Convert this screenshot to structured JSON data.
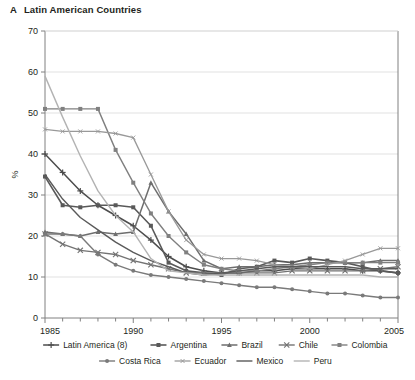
{
  "figure": {
    "panel_letter": "A",
    "title": "Latin American Countries"
  },
  "chart_data": {
    "type": "line",
    "title": "Latin American Countries",
    "xlabel": "",
    "ylabel": "%",
    "xlim": [
      1985,
      2005
    ],
    "ylim": [
      0,
      70
    ],
    "ytick_step": 10,
    "yticks": [
      0,
      10,
      20,
      30,
      40,
      50,
      60,
      70
    ],
    "xticks_labeled": [
      1985,
      1990,
      1995,
      2000,
      2005
    ],
    "x_minor_tick_step": 1,
    "grid": "horizontal",
    "legend_position": "below",
    "x": [
      1985,
      1986,
      1987,
      1988,
      1989,
      1990,
      1991,
      1992,
      1993,
      1994,
      1995,
      1996,
      1997,
      1998,
      1999,
      2000,
      2001,
      2002,
      2003,
      2004,
      2005
    ],
    "series": [
      {
        "name": "Latin America (8)",
        "color": "#4d4d4d",
        "marker": "plus",
        "width": 1.5,
        "values": [
          40,
          35.5,
          31,
          27.5,
          25,
          22.5,
          19,
          15,
          12.5,
          11.5,
          11,
          11,
          11.5,
          11.5,
          12,
          12,
          12,
          12,
          11.5,
          11.5,
          11
        ]
      },
      {
        "name": "Argentina",
        "color": "#595959",
        "marker": "square",
        "width": 1.6,
        "values": [
          34.5,
          27.5,
          27,
          27.5,
          27.5,
          27,
          22.5,
          13.5,
          11.5,
          11,
          10.5,
          12,
          12.5,
          14,
          13.5,
          14.5,
          14,
          13.5,
          12.5,
          11.5,
          11
        ]
      },
      {
        "name": "Brazil",
        "color": "#6e6e6e",
        "marker": "triangle",
        "width": 1.5,
        "values": [
          21,
          20.5,
          20,
          21,
          20.5,
          21,
          33,
          26,
          20.5,
          14,
          12,
          12.5,
          12.5,
          13,
          13,
          13.5,
          13.5,
          13.5,
          13.5,
          14,
          14
        ]
      },
      {
        "name": "Chile",
        "color": "#737373",
        "marker": "cross",
        "width": 1.4,
        "values": [
          20.5,
          18,
          16.5,
          16,
          15.5,
          14,
          13,
          12,
          11,
          11,
          11,
          11,
          11,
          11,
          11.5,
          11.5,
          11.5,
          11.5,
          11.5,
          12,
          12.5
        ]
      },
      {
        "name": "Colombia",
        "color": "#808080",
        "marker": "square",
        "width": 1.4,
        "values": [
          51,
          51,
          51,
          51,
          41,
          33,
          25.5,
          20,
          16,
          13,
          12,
          11.5,
          11.5,
          12,
          12.5,
          13,
          13.5,
          13.5,
          13.5,
          13.5,
          13.5
        ]
      },
      {
        "name": "Costa Rica",
        "color": "#7a7a7a",
        "marker": "circle",
        "width": 1.4,
        "values": [
          20.5,
          20.5,
          20,
          15.5,
          13,
          11.5,
          10.5,
          10,
          9.5,
          9,
          8.5,
          8,
          7.5,
          7.5,
          7,
          6.5,
          6,
          6,
          5.5,
          5,
          5
        ]
      },
      {
        "name": "Ecuador",
        "color": "#999999",
        "marker": "smallcross",
        "width": 1.3,
        "values": [
          46,
          45.5,
          45.5,
          45.5,
          45,
          44,
          35,
          26,
          19,
          15.5,
          14.5,
          14.5,
          14,
          13,
          12.5,
          12,
          13,
          14,
          15.5,
          17,
          17
        ]
      },
      {
        "name": "Mexico",
        "color": "#5a5a5a",
        "marker": "none",
        "width": 1.4,
        "values": [
          35,
          29,
          24.5,
          21.5,
          18.5,
          16,
          14,
          12.5,
          11,
          10.5,
          11,
          11.5,
          12,
          12.5,
          12.5,
          12.5,
          12.5,
          12.5,
          12,
          12,
          12
        ]
      },
      {
        "name": "Peru",
        "color": "#b3b3b3",
        "marker": "none",
        "width": 1.4,
        "values": [
          59,
          49,
          39.5,
          31,
          25,
          21,
          14.5,
          11.5,
          11,
          10.5,
          10.5,
          10.5,
          10.5,
          10.5,
          10.5,
          10.5,
          10.5,
          10.5,
          10.5,
          10,
          10
        ]
      }
    ]
  },
  "legend": {
    "row1": [
      "Latin America (8)",
      "Argentina",
      "Brazil",
      "Chile",
      "Colombia"
    ],
    "row2": [
      "Costa Rica",
      "Ecuador",
      "Mexico",
      "Peru"
    ]
  }
}
